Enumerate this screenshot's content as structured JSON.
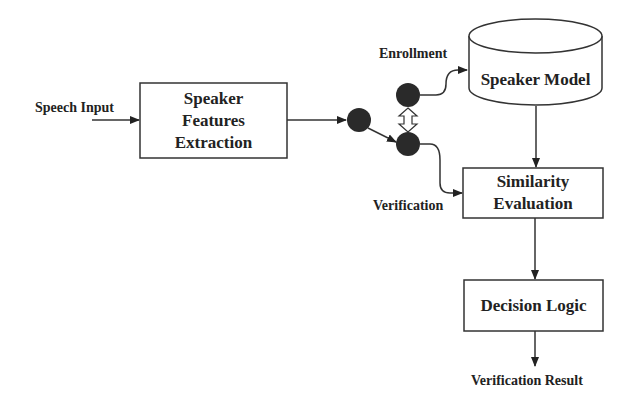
{
  "diagram": {
    "nodes": {
      "features": {
        "lines": [
          "Speaker",
          "Features",
          "Extraction"
        ]
      },
      "model": {
        "label": "Speaker Model",
        "shape": "cylinder"
      },
      "similarity": {
        "lines": [
          "Similarity",
          "Evaluation"
        ]
      },
      "decision": {
        "label": "Decision Logic"
      }
    },
    "labels": {
      "input": "Speech Input",
      "enrollment": "Enrollment",
      "verification": "Verification",
      "output": "Verification Result"
    },
    "edges": [
      {
        "from": "Speech Input",
        "to": "Speaker Features Extraction"
      },
      {
        "from": "Speaker Features Extraction",
        "to": "switch"
      },
      {
        "from": "switch",
        "to": "Speaker Model",
        "label": "Enrollment"
      },
      {
        "from": "switch",
        "to": "Similarity Evaluation",
        "label": "Verification"
      },
      {
        "from": "Speaker Model",
        "to": "Similarity Evaluation"
      },
      {
        "from": "Similarity Evaluation",
        "to": "Decision Logic"
      },
      {
        "from": "Decision Logic",
        "to": "Verification Result"
      }
    ],
    "colors": {
      "stroke": "#333333",
      "dot": "#2a2a2a",
      "text": "#222222"
    }
  }
}
